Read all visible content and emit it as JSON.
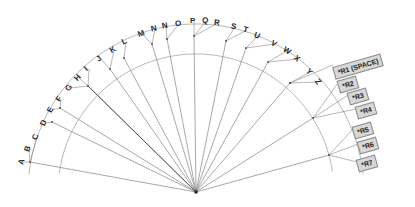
{
  "diagram": {
    "center": {
      "x": 196,
      "y": 192
    },
    "colors": {
      "stroke": "#7a7a7a",
      "stroke_dark": "#4a4a4a",
      "arc": "#9a9a9a",
      "box_fill": "#d7d7d7",
      "box_border": "#8c8c8c",
      "text": "#2b2b2b",
      "background": "#ffffff"
    },
    "arcs": [
      {
        "name": "outer-arc",
        "radius": 168,
        "start_deg": 186,
        "end_deg": 354
      },
      {
        "name": "inner-arc",
        "radius": 138,
        "start_deg": 188,
        "end_deg": 352
      }
    ],
    "letter_labels": [
      {
        "text": "A",
        "x": 19,
        "y": 158,
        "rotate": -74
      },
      {
        "text": "B",
        "x": 25,
        "y": 145,
        "rotate": -72
      },
      {
        "text": "C",
        "x": 33,
        "y": 133,
        "rotate": -70
      },
      {
        "text": "D",
        "x": 41,
        "y": 119,
        "rotate": -66
      },
      {
        "text": "E",
        "x": 48,
        "y": 106,
        "rotate": -62
      },
      {
        "text": "F",
        "x": 57,
        "y": 95,
        "rotate": -58
      },
      {
        "text": "G",
        "x": 66,
        "y": 84,
        "rotate": -52
      },
      {
        "text": "H",
        "x": 75,
        "y": 74,
        "rotate": -48
      },
      {
        "text": "I",
        "x": 85,
        "y": 65,
        "rotate": -42
      },
      {
        "text": "J",
        "x": 97,
        "y": 55,
        "rotate": -36
      },
      {
        "text": "K",
        "x": 110,
        "y": 46,
        "rotate": -30
      },
      {
        "text": "L",
        "x": 122,
        "y": 38,
        "rotate": -24
      },
      {
        "text": "M",
        "x": 138,
        "y": 30,
        "rotate": -18
      },
      {
        "text": "N",
        "x": 151,
        "y": 25,
        "rotate": -12
      },
      {
        "text": "N",
        "x": 162,
        "y": 22,
        "rotate": -9
      },
      {
        "text": "O",
        "x": 175,
        "y": 20,
        "rotate": -5
      },
      {
        "text": "P",
        "x": 190,
        "y": 17,
        "rotate": 0
      },
      {
        "text": "Q",
        "x": 202,
        "y": 17,
        "rotate": 3
      },
      {
        "text": "R",
        "x": 214,
        "y": 19,
        "rotate": 7
      },
      {
        "text": "S",
        "x": 231,
        "y": 23,
        "rotate": 13
      },
      {
        "text": "T",
        "x": 243,
        "y": 26,
        "rotate": 17
      },
      {
        "text": "U",
        "x": 254,
        "y": 32,
        "rotate": 22
      },
      {
        "text": "V",
        "x": 271,
        "y": 40,
        "rotate": 29
      },
      {
        "text": "W",
        "x": 283,
        "y": 47,
        "rotate": 34
      },
      {
        "text": "X",
        "x": 294,
        "y": 55,
        "rotate": 39
      },
      {
        "text": "Y",
        "x": 306,
        "y": 68,
        "rotate": 47
      },
      {
        "text": "Z",
        "x": 315,
        "y": 78,
        "rotate": 53
      }
    ],
    "box_labels": [
      {
        "text": "*R1 (SPACE)",
        "x": 333,
        "y": 60,
        "rotate": -16
      },
      {
        "text": "*R2",
        "x": 338,
        "y": 78,
        "rotate": -16
      },
      {
        "text": "*R3",
        "x": 348,
        "y": 90,
        "rotate": -16
      },
      {
        "text": "*R4",
        "x": 356,
        "y": 104,
        "rotate": -16
      },
      {
        "text": "*R5",
        "x": 353,
        "y": 124,
        "rotate": -16
      },
      {
        "text": "*R6",
        "x": 358,
        "y": 139,
        "rotate": -16
      },
      {
        "text": "*R7",
        "x": 357,
        "y": 157,
        "rotate": -16
      }
    ],
    "spokes": [
      {
        "name": "spoke-abc",
        "angle_deg": 190,
        "tip_x": 30,
        "tip_y": 162
      },
      {
        "name": "spoke-d",
        "angle_deg": 199,
        "tip_x": 52,
        "tip_y": 122
      },
      {
        "name": "spoke-ef",
        "angle_deg": 203,
        "tip_x": 60,
        "tip_y": 108
      },
      {
        "name": "spoke-ghi",
        "angle_deg": 213,
        "tip_x": 88,
        "tip_y": 86
      },
      {
        "name": "spoke-jk",
        "angle_deg": 222,
        "tip_x": 110,
        "tip_y": 69
      },
      {
        "name": "spoke-l",
        "angle_deg": 232,
        "tip_x": 124,
        "tip_y": 58
      },
      {
        "name": "spoke-mn",
        "angle_deg": 244,
        "tip_x": 152,
        "tip_y": 44
      },
      {
        "name": "spoke-no",
        "angle_deg": 254,
        "tip_x": 167,
        "tip_y": 39
      },
      {
        "name": "spoke-pqr",
        "angle_deg": 268,
        "tip_x": 194,
        "tip_y": 36
      },
      {
        "name": "spoke-st",
        "angle_deg": 283,
        "tip_x": 226,
        "tip_y": 41
      },
      {
        "name": "spoke-uv",
        "angle_deg": 293,
        "tip_x": 246,
        "tip_y": 48
      },
      {
        "name": "spoke-wx",
        "angle_deg": 304,
        "tip_x": 268,
        "tip_y": 62
      },
      {
        "name": "spoke-yz",
        "angle_deg": 316,
        "tip_x": 290,
        "tip_y": 83
      },
      {
        "name": "spoke-r234",
        "angle_deg": 330,
        "tip_x": 313,
        "tip_y": 118
      },
      {
        "name": "spoke-r567",
        "angle_deg": 345,
        "tip_x": 329,
        "tip_y": 155
      }
    ]
  }
}
